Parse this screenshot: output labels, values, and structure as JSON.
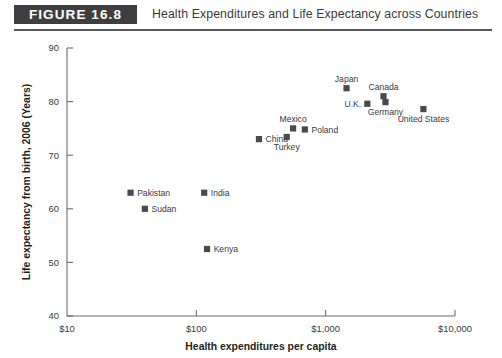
{
  "header": {
    "badge_label": "FIGURE  16.8",
    "title": "Health Expenditures and Life Expectancy across Countries"
  },
  "colors": {
    "badge_bg": "#3f3f42",
    "badge_text": "#ffffff",
    "rule": "#58585b",
    "marker": "#4a4a4d",
    "axis": "#6d6d70",
    "text": "#3a3a3c",
    "background": "#ffffff"
  },
  "chart_data": {
    "type": "scatter",
    "title": "Health Expenditures and Life Expectancy across Countries",
    "xlabel": "Health expenditures per capita",
    "ylabel": "Life expectancy from birth, 2006 (Years)",
    "xscale": "log",
    "yscale": "linear",
    "xlim": [
      10,
      10000
    ],
    "ylim": [
      40,
      90
    ],
    "xticks": [
      10,
      100,
      1000,
      10000
    ],
    "xticklabels": [
      "$10",
      "$100",
      "$1,000",
      "$10,000"
    ],
    "yticks": [
      40,
      50,
      60,
      70,
      80,
      90
    ],
    "yticklabels": [
      "40",
      "50",
      "60",
      "70",
      "80",
      "90"
    ],
    "grid": false,
    "legend": false,
    "marker_shape": "square",
    "points": [
      {
        "label": "Pakistan",
        "x": 31,
        "y": 63.0,
        "label_pos": "right"
      },
      {
        "label": "Sudan",
        "x": 40,
        "y": 60.0,
        "label_pos": "right"
      },
      {
        "label": "India",
        "x": 115,
        "y": 63.0,
        "label_pos": "right"
      },
      {
        "label": "Kenya",
        "x": 121,
        "y": 52.5,
        "label_pos": "right"
      },
      {
        "label": "China",
        "x": 305,
        "y": 73.0,
        "label_pos": "right"
      },
      {
        "label": "Turkey",
        "x": 500,
        "y": 73.4,
        "label_pos": "below"
      },
      {
        "label": "Mexico",
        "x": 560,
        "y": 75.0,
        "label_pos": "above"
      },
      {
        "label": "Poland",
        "x": 690,
        "y": 74.8,
        "label_pos": "right"
      },
      {
        "label": "Japan",
        "x": 1450,
        "y": 82.5,
        "label_pos": "above"
      },
      {
        "label": "U.K.",
        "x": 2100,
        "y": 79.6,
        "label_pos": "left"
      },
      {
        "label": "Canada",
        "x": 2800,
        "y": 81.0,
        "label_pos": "above"
      },
      {
        "label": "Germany",
        "x": 2900,
        "y": 79.9,
        "label_pos": "below"
      },
      {
        "label": "United States",
        "x": 5700,
        "y": 78.6,
        "label_pos": "below"
      }
    ]
  }
}
